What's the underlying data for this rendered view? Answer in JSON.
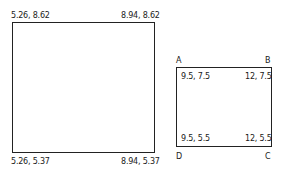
{
  "large_rectangle": {
    "top_left": "5.26, 8.62",
    "top_right": "8.94, 8.62",
    "bottom_left": "5.26, 5.37",
    "bottom_right": "8.94, 5.37"
  },
  "small_rectangle": {
    "vertices": {
      "a": "A",
      "b": "B",
      "c": "C",
      "d": "D"
    },
    "top_left": "9.5, 7.5",
    "top_right": "12, 7.5",
    "bottom_left": "9.5, 5.5",
    "bottom_right": "12, 5.5"
  }
}
